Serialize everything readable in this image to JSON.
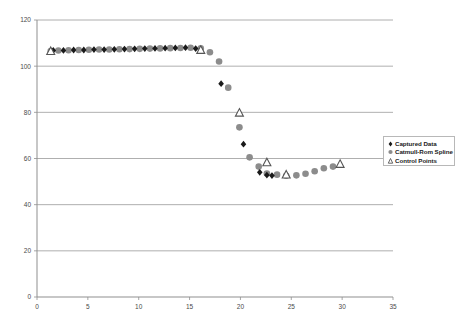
{
  "chart_data": {
    "type": "scatter",
    "title": "",
    "xlabel": "",
    "ylabel": "",
    "xlim": [
      0,
      35
    ],
    "ylim": [
      0,
      120
    ],
    "xticks": [
      0,
      5,
      10,
      15,
      20,
      25,
      30,
      35
    ],
    "yticks": [
      0,
      20,
      40,
      60,
      80,
      100,
      120
    ],
    "grid": "horizontal",
    "legend_position": "right",
    "series": [
      {
        "name": "Captured Data",
        "marker": "diamond",
        "color": "#1a1a1a",
        "points": [
          [
            1.6,
            106.8
          ],
          [
            2.6,
            106.8
          ],
          [
            3.6,
            107.0
          ],
          [
            4.6,
            107.0
          ],
          [
            5.6,
            107.2
          ],
          [
            6.6,
            107.2
          ],
          [
            7.6,
            107.3
          ],
          [
            8.6,
            107.4
          ],
          [
            9.6,
            107.5
          ],
          [
            10.6,
            107.6
          ],
          [
            11.6,
            107.7
          ],
          [
            12.6,
            107.8
          ],
          [
            13.6,
            107.9
          ],
          [
            14.6,
            108.0
          ],
          [
            15.6,
            107.6
          ],
          [
            18.1,
            92.4
          ],
          [
            20.3,
            66.2
          ],
          [
            21.9,
            54.0
          ],
          [
            22.6,
            52.8
          ],
          [
            23.1,
            52.6
          ]
        ]
      },
      {
        "name": "Catmull-Rom Spline",
        "marker": "circle",
        "color": "#8c8c8c",
        "points": [
          [
            1.35,
            106.5
          ],
          [
            2.1,
            106.8
          ],
          [
            3.1,
            106.9
          ],
          [
            4.1,
            107.0
          ],
          [
            5.1,
            107.1
          ],
          [
            6.1,
            107.2
          ],
          [
            7.1,
            107.2
          ],
          [
            8.1,
            107.3
          ],
          [
            9.1,
            107.4
          ],
          [
            10.1,
            107.5
          ],
          [
            11.1,
            107.6
          ],
          [
            12.1,
            107.7
          ],
          [
            13.1,
            107.8
          ],
          [
            14.1,
            107.9
          ],
          [
            15.1,
            108.0
          ],
          [
            16.1,
            107.7
          ],
          [
            17.0,
            106.0
          ],
          [
            17.9,
            102.0
          ],
          [
            18.8,
            90.7
          ],
          [
            19.9,
            73.5
          ],
          [
            20.9,
            60.5
          ],
          [
            21.8,
            56.5
          ],
          [
            22.6,
            53.5
          ],
          [
            23.6,
            53.0
          ],
          [
            24.5,
            52.5
          ],
          [
            25.5,
            52.7
          ],
          [
            26.4,
            53.4
          ],
          [
            27.3,
            54.5
          ],
          [
            28.2,
            55.8
          ],
          [
            29.1,
            56.5
          ]
        ]
      },
      {
        "name": "Control Points",
        "marker": "triangle",
        "color": "#555555",
        "points": [
          [
            1.35,
            106.5
          ],
          [
            16.1,
            107.0
          ],
          [
            19.9,
            79.8
          ],
          [
            22.6,
            58.3
          ],
          [
            24.5,
            53.0
          ],
          [
            29.8,
            57.6
          ]
        ]
      }
    ]
  },
  "legend": {
    "items": [
      {
        "label": "Captured Data",
        "marker": "diamond"
      },
      {
        "label": "Catmull-Rom Spline",
        "marker": "circle"
      },
      {
        "label": "Control Points",
        "marker": "triangle"
      }
    ]
  },
  "axes": {
    "x_tick_labels": [
      "0",
      "5",
      "10",
      "15",
      "20",
      "25",
      "30",
      "35"
    ],
    "y_tick_labels": [
      "0",
      "20",
      "40",
      "60",
      "80",
      "100",
      "120"
    ]
  },
  "colors": {
    "captured": "#1a1a1a",
    "spline": "#8c8c8c",
    "control": "#555555",
    "grid": "#9a9a9a",
    "axis": "#8f8f8f",
    "text": "#4a4a4a"
  }
}
